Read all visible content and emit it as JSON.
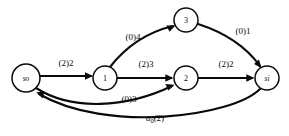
{
  "figure": {
    "name": "flow-network-diagram",
    "background": "#ffffff",
    "ink_color": "#0a0a0a",
    "width": 289,
    "height": 136
  },
  "nodes": [
    {
      "id": "so",
      "label": "so",
      "style": "italic",
      "cx": 26,
      "cy": 78,
      "r": 14
    },
    {
      "id": "n1",
      "label": "1",
      "style": "normal",
      "cx": 105,
      "cy": 78,
      "r": 12
    },
    {
      "id": "n2",
      "label": "2",
      "style": "normal",
      "cx": 186,
      "cy": 78,
      "r": 12
    },
    {
      "id": "n3",
      "label": "3",
      "style": "normal",
      "cx": 186,
      "cy": 20,
      "r": 12
    },
    {
      "id": "si",
      "label": "si",
      "style": "italic",
      "cx": 267,
      "cy": 78,
      "r": 12
    }
  ],
  "edges": [
    {
      "id": "so-1",
      "from": "so",
      "to": "n1",
      "label": "(2)2",
      "flow": 2,
      "capacity": 2,
      "label_x": 66,
      "label_y": 63,
      "path": "M 40 76 L 91 76",
      "arrow": "M 93 76 L 85 72.3 L 85 79.7 Z"
    },
    {
      "id": "1-3",
      "from": "n1",
      "to": "n3",
      "label": "(0)4",
      "flow": 0,
      "capacity": 4,
      "label_x": 133,
      "label_y": 37,
      "path": "M 110 67 C 124 49 144 33 173 26",
      "arrow": "M 175.4 25.4 L 166.2 25.6 L 169.6 31.8 Z"
    },
    {
      "id": "3-si",
      "from": "n3",
      "to": "si",
      "label": "(0)1",
      "flow": 0,
      "capacity": 1,
      "label_x": 243,
      "label_y": 31,
      "path": "M 198 24 C 226 33 247 48 260 66",
      "arrow": "M 261.6 68.2 L 258.9 59.4 L 254.1 64 Z"
    },
    {
      "id": "1-2",
      "from": "n1",
      "to": "n2",
      "label": "(2)3",
      "flow": 2,
      "capacity": 3,
      "label_x": 146,
      "label_y": 64,
      "path": "M 117 78 L 171 78",
      "arrow": "M 173.5 78 L 165.3 74.3 L 165.3 81.7 Z"
    },
    {
      "id": "2-si",
      "from": "n2",
      "to": "si",
      "label": "(2)2",
      "flow": 2,
      "capacity": 2,
      "label_x": 226,
      "label_y": 64,
      "path": "M 198 78 L 252 78",
      "arrow": "M 254.5 78 L 246.3 74.3 L 246.3 81.7 Z"
    },
    {
      "id": "so-2",
      "from": "so",
      "to": "n2",
      "label": "(0)3",
      "flow": 0,
      "capacity": 3,
      "label_x": 129,
      "label_y": 99,
      "path": "M 36 88 C 72 111 126 108 172 86",
      "arrow": "M 174.6 84.8 L 165.4 84.1 L 168.5 90.5 Z"
    },
    {
      "id": "si-so",
      "from": "si",
      "to": "so",
      "label": "a₀(2)",
      "label_main": "a",
      "label_sub": "0",
      "label_tail": "(2)",
      "flow": 2,
      "label_x": 155,
      "label_y": 118,
      "path": "M 260 89 C 232 117 106 133 39 94",
      "arrow": "M 36.2 92.2 L 42.8 98.6 L 44.4 91.4 Z"
    }
  ],
  "legend": {
    "notation": "(flow)capacity"
  }
}
